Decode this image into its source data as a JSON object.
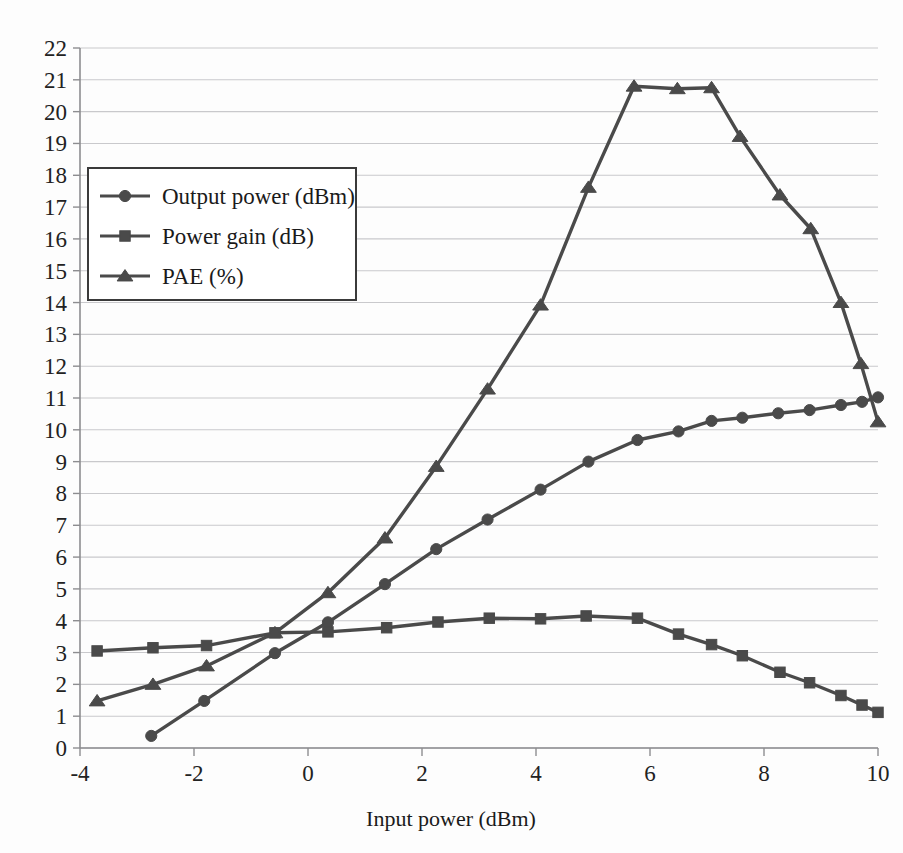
{
  "figure": {
    "background_color": "#fdfdfd",
    "line_color": "#4a4a4a",
    "grid_color": "#c9c9cc",
    "axis_color": "#8d8d90"
  },
  "axes": {
    "x": {
      "label": "Input power (dBm)",
      "min": -4,
      "max": 10,
      "tick_step": 2,
      "tick_labels": [
        "-4",
        "-2",
        "0",
        "2",
        "4",
        "6",
        "8",
        "10"
      ],
      "tick_values": [
        -4,
        -2,
        0,
        2,
        4,
        6,
        8,
        10
      ]
    },
    "y": {
      "label": "",
      "min": 0,
      "max": 22,
      "tick_step": 1,
      "tick_labels": [
        "0",
        "1",
        "2",
        "3",
        "4",
        "5",
        "6",
        "7",
        "8",
        "9",
        "10",
        "11",
        "12",
        "13",
        "14",
        "15",
        "16",
        "17",
        "18",
        "19",
        "20",
        "21",
        "22"
      ],
      "tick_values": [
        0,
        1,
        2,
        3,
        4,
        5,
        6,
        7,
        8,
        9,
        10,
        11,
        12,
        13,
        14,
        15,
        16,
        17,
        18,
        19,
        20,
        21,
        22
      ]
    },
    "grid": "horizontal"
  },
  "legend": {
    "position": "upper-left-inset",
    "border_color": "#3a3a3a",
    "entries": [
      {
        "label": "Output power (dBm)",
        "marker": "circle"
      },
      {
        "label": "Power gain (dB)",
        "marker": "square"
      },
      {
        "label": "PAE (%)",
        "marker": "triangle"
      }
    ]
  },
  "chart_data": {
    "type": "line",
    "title": "",
    "xlabel": "Input power (dBm)",
    "ylabel": "",
    "xlim": [
      -4,
      10
    ],
    "ylim": [
      0,
      22
    ],
    "grid": true,
    "legend_position": "upper-left-inset",
    "series": [
      {
        "name": "Output power (dBm)",
        "marker": "circle",
        "color": "#4a4a4a",
        "points": [
          [
            -2.75,
            0.38
          ],
          [
            -1.82,
            1.48
          ],
          [
            -0.58,
            2.98
          ],
          [
            0.35,
            3.95
          ],
          [
            1.35,
            5.15
          ],
          [
            2.25,
            6.25
          ],
          [
            3.15,
            7.18
          ],
          [
            4.08,
            8.12
          ],
          [
            4.92,
            9.0
          ],
          [
            5.78,
            9.68
          ],
          [
            6.5,
            9.95
          ],
          [
            7.08,
            10.28
          ],
          [
            7.62,
            10.38
          ],
          [
            8.25,
            10.52
          ],
          [
            8.8,
            10.62
          ],
          [
            9.35,
            10.78
          ],
          [
            9.72,
            10.88
          ],
          [
            10.0,
            11.02
          ]
        ]
      },
      {
        "name": "Power gain (dB)",
        "marker": "square",
        "color": "#4a4a4a",
        "points": [
          [
            -3.7,
            3.05
          ],
          [
            -2.72,
            3.15
          ],
          [
            -1.78,
            3.22
          ],
          [
            -0.58,
            3.62
          ],
          [
            0.35,
            3.65
          ],
          [
            1.38,
            3.78
          ],
          [
            2.28,
            3.96
          ],
          [
            3.18,
            4.08
          ],
          [
            4.08,
            4.06
          ],
          [
            4.88,
            4.15
          ],
          [
            5.78,
            4.08
          ],
          [
            6.5,
            3.58
          ],
          [
            7.08,
            3.25
          ],
          [
            7.62,
            2.9
          ],
          [
            8.28,
            2.38
          ],
          [
            8.8,
            2.05
          ],
          [
            9.35,
            1.65
          ],
          [
            9.72,
            1.35
          ],
          [
            10.0,
            1.12
          ]
        ]
      },
      {
        "name": "PAE (%)",
        "marker": "triangle",
        "color": "#4a4a4a",
        "points": [
          [
            -3.7,
            1.48
          ],
          [
            -2.72,
            2.0
          ],
          [
            -1.78,
            2.58
          ],
          [
            -0.58,
            3.62
          ],
          [
            0.35,
            4.88
          ],
          [
            1.35,
            6.6
          ],
          [
            2.25,
            8.85
          ],
          [
            3.15,
            11.28
          ],
          [
            4.08,
            13.92
          ],
          [
            4.92,
            17.62
          ],
          [
            5.72,
            20.8
          ],
          [
            6.48,
            20.72
          ],
          [
            7.08,
            20.75
          ],
          [
            7.58,
            19.22
          ],
          [
            8.28,
            17.38
          ],
          [
            8.82,
            16.32
          ],
          [
            9.35,
            14.0
          ],
          [
            9.7,
            12.08
          ],
          [
            10.0,
            10.25
          ]
        ]
      }
    ]
  }
}
